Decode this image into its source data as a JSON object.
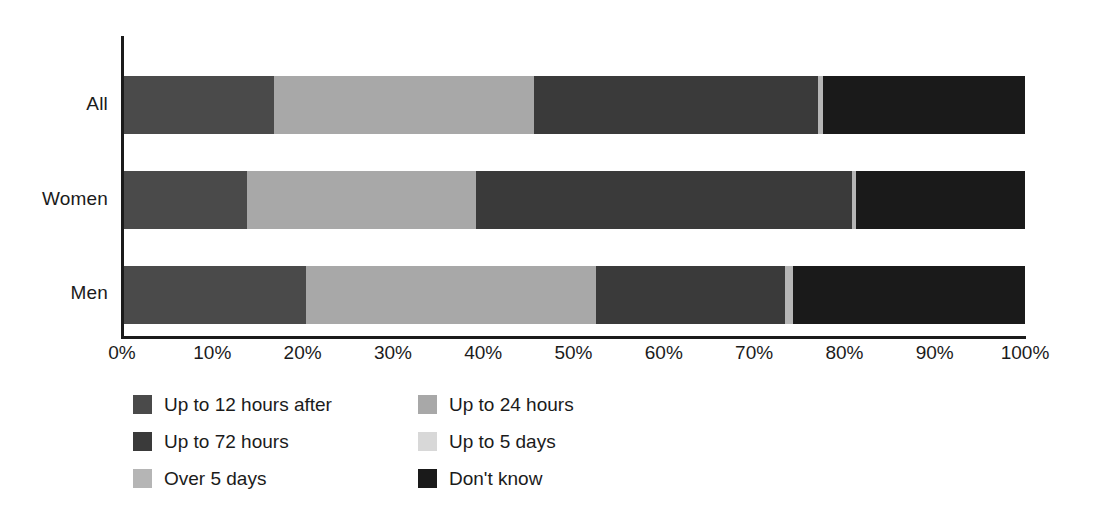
{
  "chart_data": {
    "type": "bar",
    "orientation": "horizontal",
    "stacked": true,
    "stack_mode": "percent",
    "title": "",
    "subtitle": "",
    "xlabel": "",
    "ylabel": "",
    "xlim": [
      0,
      100
    ],
    "xticks": [
      "0%",
      "10%",
      "20%",
      "30%",
      "40%",
      "50%",
      "60%",
      "70%",
      "80%",
      "90%",
      "100%"
    ],
    "xtick_values": [
      0,
      10,
      20,
      30,
      40,
      50,
      60,
      70,
      80,
      90,
      100
    ],
    "grid": false,
    "legend_position": "bottom-left",
    "categories": [
      "All",
      "Women",
      "Men"
    ],
    "series": [
      {
        "name": "Up to 12 hours after",
        "color": "#4a4a4a",
        "values": [
          16.7,
          13.6,
          20.2
        ]
      },
      {
        "name": "Up to 24 hours",
        "color": "#a8a8a8",
        "values": [
          28.8,
          25.5,
          32.2
        ]
      },
      {
        "name": "Up to 72 hours",
        "color": "#3a3a3a",
        "values": [
          31.5,
          41.7,
          21.0
        ]
      },
      {
        "name": "Up to 5 days",
        "color": "#d8d8d8",
        "values": [
          0.0,
          0.0,
          0.0
        ]
      },
      {
        "name": "Over 5 days",
        "color": "#b5b5b5",
        "values": [
          0.6,
          0.5,
          0.8
        ]
      },
      {
        "name": "Don't know",
        "color": "#1a1a1a",
        "values": [
          22.4,
          18.7,
          25.8
        ]
      }
    ]
  },
  "legend": {
    "items": [
      {
        "label": "Up to 12 hours after",
        "color": "#4a4a4a"
      },
      {
        "label": "Up to 24 hours",
        "color": "#a8a8a8"
      },
      {
        "label": "Up to 72 hours",
        "color": "#3a3a3a"
      },
      {
        "label": "Up to 5 days",
        "color": "#d8d8d8"
      },
      {
        "label": "Over 5 days",
        "color": "#b5b5b5"
      },
      {
        "label": "Don't know",
        "color": "#1a1a1a"
      }
    ]
  },
  "axis": {
    "ticks": [
      "0%",
      "10%",
      "20%",
      "30%",
      "40%",
      "50%",
      "60%",
      "70%",
      "80%",
      "90%",
      "100%"
    ]
  },
  "categories": {
    "all": "All",
    "women": "Women",
    "men": "Men"
  },
  "colors": {
    "axis": "#1b1b1b",
    "background": "#ffffff",
    "text": "#1b1b1b"
  }
}
